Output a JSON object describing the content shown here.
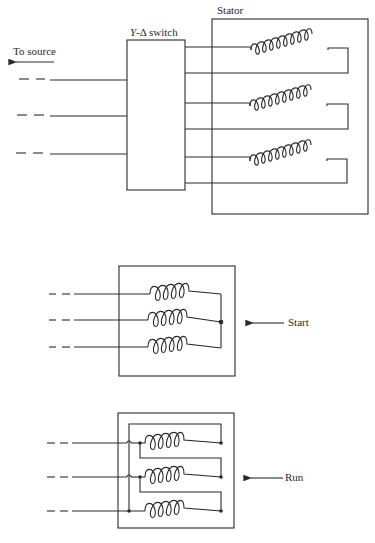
{
  "diagram": {
    "colors": {
      "ink": "#2a2a2a",
      "background": "#ffffff"
    },
    "top_section": {
      "source_label": "To source",
      "switch_label_italic": "Y",
      "switch_label_rest": "-Δ switch",
      "stator_label": "Stator",
      "phases": 3,
      "coil_turns": 8
    },
    "start_section": {
      "label": "Start",
      "connection": "wye",
      "phases": 3,
      "coil_turns": 4
    },
    "run_section": {
      "label": "Run",
      "connection": "delta",
      "phases": 3,
      "coil_turns": 4
    }
  }
}
